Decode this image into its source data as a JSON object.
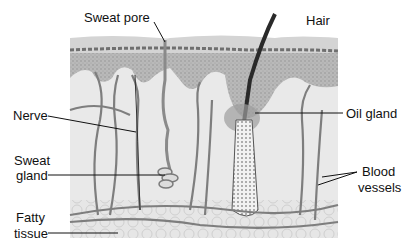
{
  "diagram": {
    "labels": {
      "sweat_pore": "Sweat pore",
      "hair": "Hair",
      "nerve": "Nerve",
      "oil_gland": "Oil gland",
      "sweat_gland_line1": "Sweat",
      "sweat_gland_line2": "gland",
      "blood_vessels_line1": "Blood",
      "blood_vessels_line2": "vessels",
      "fatty_tissue_line1": "Fatty",
      "fatty_tissue_line2": "tissue"
    }
  }
}
